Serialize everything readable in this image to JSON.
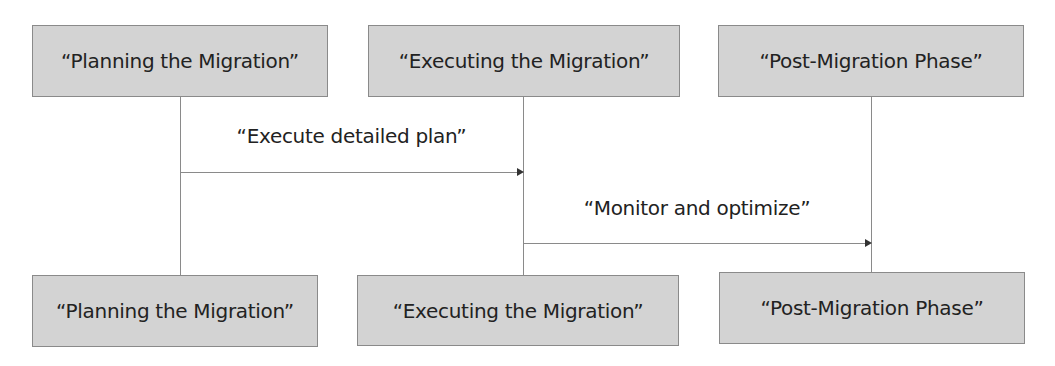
{
  "diagram": {
    "type": "sequence",
    "participants": [
      {
        "id": "p1",
        "label": "“Planning the Migration”"
      },
      {
        "id": "p2",
        "label": "“Executing the Migration”"
      },
      {
        "id": "p3",
        "label": "“Post-Migration Phase”"
      }
    ],
    "messages": [
      {
        "from": "p1",
        "to": "p2",
        "label": "“Execute detailed plan”"
      },
      {
        "from": "p2",
        "to": "p3",
        "label": "“Monitor and optimize”"
      }
    ],
    "colors": {
      "actor_fill": "#d3d3d3",
      "line": "#8a8a8a"
    }
  }
}
